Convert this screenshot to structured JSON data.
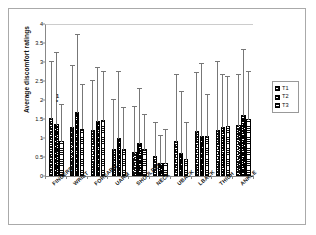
{
  "chart_data": {
    "type": "bar",
    "title": "",
    "subtitle": "",
    "xlabel": "",
    "ylabel": "Average discomfort ratings",
    "ylim": [
      0,
      4
    ],
    "yticks": [
      0,
      0.5,
      1,
      1.5,
      2,
      2.5,
      3,
      3.5,
      4
    ],
    "ytick_labels": [
      "0",
      "0.5",
      "1",
      "1.5",
      "2",
      "2.5",
      "3",
      "3.5",
      "4"
    ],
    "grid": false,
    "legend_position": "right",
    "error_bars": "upper-only",
    "categories": [
      "FINGERS",
      "WRIST",
      "FOREARM",
      "UARM",
      "SHOULDER",
      "NECK",
      "UBACK",
      "LBACK",
      "THIGH",
      "ANKLE"
    ],
    "series": [
      {
        "name": "T1",
        "pattern": "chevron-light",
        "values": [
          1.52,
          1.29,
          1.22,
          0.72,
          0.63,
          0.52,
          0.92,
          1.19,
          1.21,
          1.35
        ],
        "errors_upper": [
          3.05,
          2.96,
          2.56,
          2.05,
          1.88,
          1.46,
          2.72,
          2.77,
          3.04,
          2.71
        ]
      },
      {
        "name": "T2",
        "pattern": "chevron-dark",
        "values": [
          1.38,
          1.69,
          1.46,
          1.0,
          0.88,
          0.33,
          0.61,
          1.06,
          1.3,
          1.61
        ],
        "errors_upper": [
          3.3,
          3.76,
          2.9,
          2.79,
          2.34,
          1.1,
          2.27,
          3.0,
          2.7,
          3.38
        ]
      },
      {
        "name": "T3",
        "pattern": "horizontal-stripes",
        "values": [
          0.91,
          1.25,
          1.47,
          0.7,
          0.7,
          0.35,
          0.44,
          1.04,
          1.32,
          1.5
        ],
        "errors_upper": [
          1.93,
          2.46,
          2.78,
          1.85,
          1.66,
          1.26,
          1.44,
          2.18,
          2.67,
          2.78
        ]
      }
    ],
    "annotations": [
      {
        "text": "1",
        "series": "T3",
        "category": "FINGERS",
        "y": 2.12
      },
      {
        "text": "*",
        "series": "T3",
        "category": "FINGERS",
        "y": 1.97
      }
    ]
  },
  "legend": {
    "title": "",
    "entries": [
      {
        "label": "T1"
      },
      {
        "label": "T2"
      },
      {
        "label": "T3"
      }
    ]
  },
  "axes": {
    "y_title": "Average discomfort ratings"
  },
  "colors": {
    "axis": "#888888",
    "bar_outline": "#000000",
    "error_bar": "#777777",
    "frame": "#aaaaaa",
    "text": "#111111",
    "background": "#ffffff"
  }
}
